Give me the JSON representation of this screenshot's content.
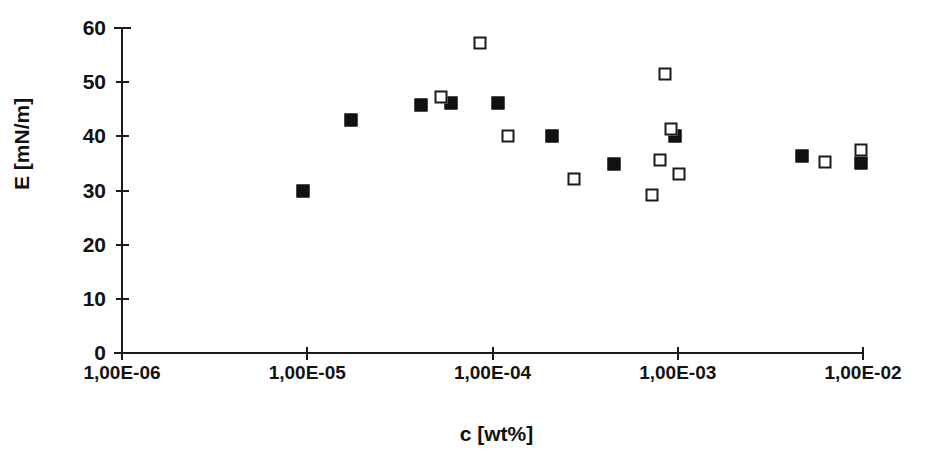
{
  "chart_data": {
    "type": "scatter",
    "title": "",
    "xlabel": "c [wt%]",
    "ylabel": "E [mN/m]",
    "xscale": "log",
    "xlim": [
      1e-06,
      0.01
    ],
    "ylim": [
      0,
      60
    ],
    "grid": false,
    "legend": "none",
    "xticklabels": [
      "1,00E-06",
      "1,00E-05",
      "1,00E-04",
      "1,00E-03",
      "1,00E-02"
    ],
    "xtickvalues": [
      1e-06,
      1e-05,
      0.0001,
      0.001,
      0.01
    ],
    "yticklabels": [
      "0",
      "10",
      "20",
      "30",
      "40",
      "50",
      "60"
    ],
    "ytickvalues": [
      0,
      10,
      20,
      30,
      40,
      50,
      60
    ],
    "series": [
      {
        "name": "filled-squares",
        "marker": "filled-square",
        "color": "#111111",
        "points": [
          {
            "x": 9.5e-06,
            "y": 30.0
          },
          {
            "x": 1.73e-05,
            "y": 43.1
          },
          {
            "x": 4.1e-05,
            "y": 45.7
          },
          {
            "x": 6e-05,
            "y": 46.1
          },
          {
            "x": 0.000107,
            "y": 46.2
          },
          {
            "x": 0.00021,
            "y": 40.0
          },
          {
            "x": 0.00045,
            "y": 34.9
          },
          {
            "x": 0.00097,
            "y": 40.1
          },
          {
            "x": 0.0047,
            "y": 36.4
          },
          {
            "x": 0.0098,
            "y": 35.1
          }
        ]
      },
      {
        "name": "open-squares",
        "marker": "open-square",
        "color": "#1b1b1b",
        "points": [
          {
            "x": 5.3e-05,
            "y": 47.3
          },
          {
            "x": 8.6e-05,
            "y": 57.3
          },
          {
            "x": 0.000122,
            "y": 40.1
          },
          {
            "x": 0.000275,
            "y": 32.2
          },
          {
            "x": 0.00073,
            "y": 29.1
          },
          {
            "x": 0.00085,
            "y": 51.6
          },
          {
            "x": 0.0008,
            "y": 35.6
          },
          {
            "x": 0.00092,
            "y": 41.4
          },
          {
            "x": 0.00102,
            "y": 33.1
          },
          {
            "x": 0.0062,
            "y": 35.3
          },
          {
            "x": 0.0098,
            "y": 37.4
          }
        ]
      }
    ]
  },
  "axes": {
    "x_title": "c [wt%]",
    "y_title": "E [mN/m]"
  }
}
